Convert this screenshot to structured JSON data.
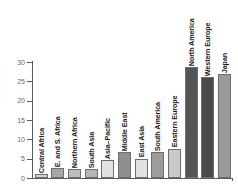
{
  "chart_data": {
    "type": "bar",
    "title": "",
    "subtitle": "",
    "xlabel": "",
    "ylabel": "",
    "ylim": [
      0,
      30
    ],
    "yticks": [
      0,
      5,
      10,
      15,
      20,
      25,
      30
    ],
    "ytick_labels": [
      "0",
      "5",
      "10",
      "15",
      "20",
      "25",
      "30"
    ],
    "grid": false,
    "legend": false,
    "categories": [
      "Central Africa",
      "E. and S. Africa",
      "Northern Africa",
      "South Asia",
      "Asia–Pacific",
      "Middle East",
      "East Asia",
      "South America",
      "Eastern Europe",
      "North America",
      "Western Europe",
      "Japan"
    ],
    "values": [
      1.0,
      2.5,
      2.3,
      2.4,
      4.7,
      6.7,
      5.0,
      6.7,
      7.6,
      28.6,
      26.2,
      26.8
    ],
    "bar_colors": [
      "#d3d3d3",
      "#a6a6a6",
      "#bdbdbd",
      "#b5b5b5",
      "#e2e2e2",
      "#8f8f8f",
      "#e0e0e0",
      "#9c9c9c",
      "#c9c9c9",
      "#555555",
      "#4a4a4a",
      "#9a9a9a"
    ],
    "bar_edge_color": "#6e6e6e",
    "axis_color": "#5b5b5b",
    "tick_label_color": "#6a6a6a",
    "category_label_color": "#1c1c1c",
    "background_color": "#ffffff"
  }
}
